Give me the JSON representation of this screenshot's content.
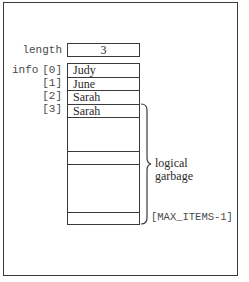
{
  "diagram": {
    "length": {
      "label": "length",
      "value": "3"
    },
    "info": {
      "label": "info",
      "indices": [
        "[0]",
        "[1]",
        "[2]",
        "[3]"
      ],
      "cells": [
        "Judy",
        "June",
        "Sarah",
        "Sarah"
      ]
    },
    "brace": {
      "annotation_line1": "logical",
      "annotation_line2": "garbage"
    },
    "last_index_label": "[MAX_ITEMS-1]"
  },
  "colors": {
    "line": "#3a3a3a",
    "label_text": "#4a4a4a",
    "cell_text": "#2a2a2a",
    "background": "#ffffff"
  }
}
